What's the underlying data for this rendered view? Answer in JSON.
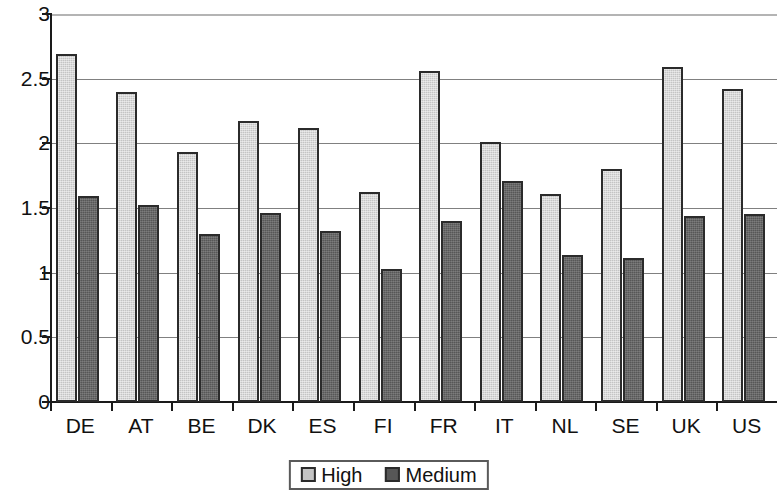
{
  "chart_data": {
    "type": "bar",
    "title": "",
    "subtitle": "",
    "xlabel": "",
    "ylabel": "",
    "ylim": [
      0,
      3
    ],
    "ytick_labels": [
      "0",
      "0.5",
      "1",
      "1.5",
      "2",
      "2.5",
      "3"
    ],
    "ytick_values": [
      0,
      0.5,
      1,
      1.5,
      2,
      2.5,
      3
    ],
    "grid": true,
    "grid_axis": "y",
    "legend_position": "bottom-center",
    "categories": [
      "DE",
      "AT",
      "BE",
      "DK",
      "ES",
      "FI",
      "FR",
      "IT",
      "NL",
      "SE",
      "UK",
      "US"
    ],
    "series": [
      {
        "name": "High",
        "color": "#c4c4c4",
        "values": [
          2.69,
          2.4,
          1.93,
          2.17,
          2.12,
          1.62,
          2.56,
          2.01,
          1.61,
          1.8,
          2.59,
          2.42
        ]
      },
      {
        "name": "Medium",
        "color": "#575757",
        "values": [
          1.59,
          1.52,
          1.3,
          1.46,
          1.32,
          1.03,
          1.4,
          1.71,
          1.14,
          1.11,
          1.44,
          1.45
        ]
      }
    ]
  },
  "legend": {
    "items": [
      {
        "label": "High",
        "swatch": "light-gray-swatch"
      },
      {
        "label": "Medium",
        "swatch": "dark-gray-swatch"
      }
    ]
  },
  "colors": {
    "high": "#c4c4c4",
    "medium": "#575757",
    "axis": "#1a1a1a",
    "grid": "#808080",
    "text": "#111111",
    "background": "#ffffff"
  }
}
